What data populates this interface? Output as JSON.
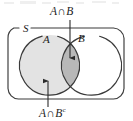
{
  "figure": {
    "type": "venn-diagram",
    "background_color": "#ffffff",
    "stroke_color": "#3a3a3a",
    "labels": {
      "sample_space": "S",
      "set_a": "A",
      "set_b": "B",
      "top_callout": {
        "left": "A",
        "operator": "∩",
        "right": "B"
      },
      "bottom_callout": {
        "left": "A",
        "operator": "∩",
        "right": "B",
        "superscript": "c"
      }
    },
    "regions": [
      {
        "name": "a-only",
        "expression": "A ∩ Bᶜ",
        "fill": "#e3e3e3",
        "shaded": true
      },
      {
        "name": "intersection",
        "expression": "A ∩ B",
        "fill": "#b8b8b8",
        "shaded": true
      },
      {
        "name": "b-only",
        "expression": "Aᶜ ∩ B",
        "fill": "#ffffff",
        "shaded": false
      },
      {
        "name": "outside",
        "expression": "Aᶜ ∩ Bᶜ",
        "fill": "#ffffff",
        "shaded": false
      }
    ],
    "geometry": {
      "frame": {
        "x": 8,
        "y": 28,
        "width": 116,
        "height": 71,
        "radius": 11
      },
      "circle_a": {
        "cx": 50,
        "cy": 65,
        "r": 30
      },
      "circle_b": {
        "cx": 92,
        "cy": 65,
        "r": 30
      },
      "arrow_top": {
        "x": 70,
        "y1": 20,
        "y2": 60
      },
      "arrow_bottom": {
        "x": 48,
        "y1": 107,
        "y2": 79
      }
    }
  }
}
